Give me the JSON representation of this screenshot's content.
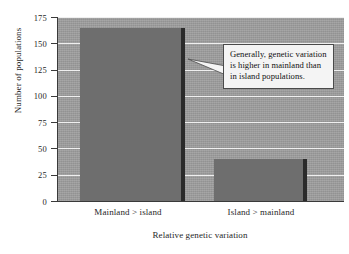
{
  "chart_data": {
    "type": "bar",
    "title": "",
    "categories": [
      "Mainland > island",
      "Island > mainland"
    ],
    "values": [
      165,
      40
    ],
    "xlabel": "Relative genetic variation",
    "ylabel": "Number of populations",
    "ylim": [
      0,
      175
    ],
    "yticks": [
      0,
      25,
      50,
      75,
      100,
      125,
      150,
      175
    ],
    "ytick_labels": [
      "0",
      "25",
      "50",
      "75",
      "100",
      "125",
      "150",
      "175"
    ],
    "grid": true,
    "legend": "none",
    "annotations": [
      {
        "text": "Generally, genetic variation is higher in mainland than in island populations.",
        "points_to": "Mainland > island"
      }
    ],
    "colors": {
      "plot_background": "#9e9e9e",
      "bar_fill": "#6e6e6e",
      "bar_shadow": "#2b2b2b",
      "gridline": "#efefef",
      "axis": "#3a3a3a",
      "annotation_background": "#f4f4f4",
      "annotation_border": "#4a4a4a",
      "text": "#1f1f1f"
    }
  }
}
